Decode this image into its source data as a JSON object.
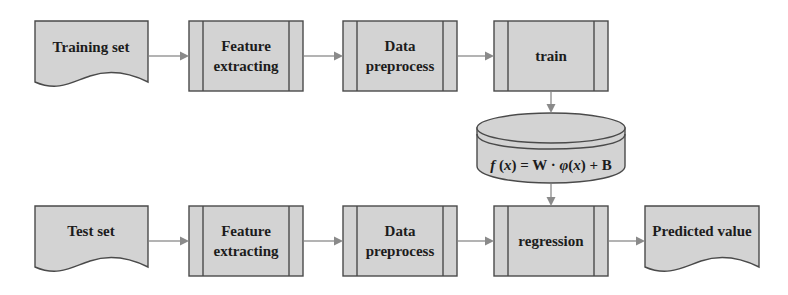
{
  "diagram": {
    "type": "flowchart",
    "colors": {
      "node_fill": "#d3d3d3",
      "node_stroke": "#4a4a4a",
      "arrow": "#8a8a8a",
      "text": "#1c1c1c",
      "background": "#ffffff"
    },
    "rows": {
      "training": [
        {
          "id": "training-set",
          "shape": "document",
          "lines": [
            "Training set"
          ]
        },
        {
          "id": "feature-extracting-1",
          "shape": "predefined-process",
          "lines": [
            "Feature",
            "extracting"
          ]
        },
        {
          "id": "data-preprocess-1",
          "shape": "predefined-process",
          "lines": [
            "Data",
            "preprocess"
          ]
        },
        {
          "id": "train",
          "shape": "predefined-process",
          "lines": [
            "train"
          ]
        }
      ],
      "model": {
        "id": "model-store",
        "shape": "database",
        "formula": "f(x) = W · φ(x) + B"
      },
      "testing": [
        {
          "id": "test-set",
          "shape": "document",
          "lines": [
            "Test set"
          ]
        },
        {
          "id": "feature-extracting-2",
          "shape": "predefined-process",
          "lines": [
            "Feature",
            "extracting"
          ]
        },
        {
          "id": "data-preprocess-2",
          "shape": "predefined-process",
          "lines": [
            "Data",
            "preprocess"
          ]
        },
        {
          "id": "regression",
          "shape": "predefined-process",
          "lines": [
            "regression"
          ]
        },
        {
          "id": "predicted-value",
          "shape": "document",
          "lines": [
            "Predicted value"
          ]
        }
      ]
    },
    "edges": [
      [
        "training-set",
        "feature-extracting-1"
      ],
      [
        "feature-extracting-1",
        "data-preprocess-1"
      ],
      [
        "data-preprocess-1",
        "train"
      ],
      [
        "train",
        "model-store"
      ],
      [
        "model-store",
        "regression"
      ],
      [
        "test-set",
        "feature-extracting-2"
      ],
      [
        "feature-extracting-2",
        "data-preprocess-2"
      ],
      [
        "data-preprocess-2",
        "regression"
      ],
      [
        "regression",
        "predicted-value"
      ]
    ]
  }
}
